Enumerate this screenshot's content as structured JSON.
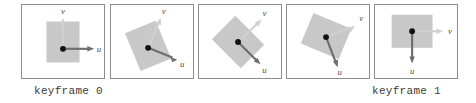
{
  "figure": {
    "panel_count": 5,
    "colors": {
      "panel_border": "#8d8d8d",
      "rect_fill": "#c8c8c8",
      "u_arrow": "#6e6e6e",
      "v_arrow": "#d0d0d0",
      "origin_dot": "#101010",
      "caption_text": "#3b3b3b",
      "label_text": "#4a4a4a",
      "background": "#ffffff"
    },
    "panels": [
      {
        "index": 0,
        "name": "panel-keyframe-0",
        "rotation_deg": 0,
        "rect": {
          "cx": 42,
          "cy": 38,
          "w": 34,
          "h": 42
        },
        "origin": {
          "x": 42,
          "y": 45
        },
        "u_vector": {
          "label": "u",
          "dx": 30,
          "dy": 0,
          "label_x": 79,
          "label_y": 45
        },
        "v_vector": {
          "label": "v",
          "dx": 0,
          "dy": -30,
          "label_x": 42,
          "label_y": 9
        }
      },
      {
        "index": 1,
        "name": "panel-step-1",
        "rotation_deg": 22.5,
        "rect": {
          "cx": 38,
          "cy": 42,
          "w": 34,
          "h": 42
        },
        "origin": {
          "x": 38,
          "y": 44
        },
        "u_vector": {
          "label": "u",
          "dx": 27.7,
          "dy": 11.5,
          "label_x": 73,
          "label_y": 62
        },
        "v_vector": {
          "label": "v",
          "dx": 11.5,
          "dy": -27.7,
          "label_x": 57,
          "label_y": 9
        }
      },
      {
        "index": 2,
        "name": "panel-step-2",
        "rotation_deg": 45,
        "rect": {
          "cx": 40,
          "cy": 38,
          "w": 34,
          "h": 42
        },
        "origin": {
          "x": 40,
          "y": 38
        },
        "u_vector": {
          "label": "u",
          "dx": 21.2,
          "dy": 21.2,
          "label_x": 68,
          "label_y": 68
        },
        "v_vector": {
          "label": "v",
          "dx": 21.2,
          "dy": -21.2,
          "label_x": 68,
          "label_y": 10
        }
      },
      {
        "index": 3,
        "name": "panel-step-3",
        "rotation_deg": 67.5,
        "rect": {
          "cx": 40,
          "cy": 32,
          "w": 34,
          "h": 42
        },
        "origin": {
          "x": 40,
          "y": 33
        },
        "u_vector": {
          "label": "u",
          "dx": 11.5,
          "dy": 27.7,
          "label_x": 53,
          "label_y": 70
        },
        "v_vector": {
          "label": "v",
          "dx": 27.7,
          "dy": -11.5,
          "label_x": 75,
          "label_y": 14
        }
      },
      {
        "index": 4,
        "name": "panel-keyframe-1",
        "rotation_deg": 90,
        "rect": {
          "cx": 38,
          "cy": 27,
          "w": 42,
          "h": 34
        },
        "origin": {
          "x": 38,
          "y": 27
        },
        "u_vector": {
          "label": "u",
          "dx": 0,
          "dy": 30,
          "label_x": 38,
          "label_y": 70
        },
        "v_vector": {
          "label": "v",
          "dx": 30,
          "dy": 0,
          "label_x": 76,
          "label_y": 27
        }
      }
    ]
  },
  "captions": {
    "left": "keyframe 0",
    "right": "keyframe 1"
  }
}
